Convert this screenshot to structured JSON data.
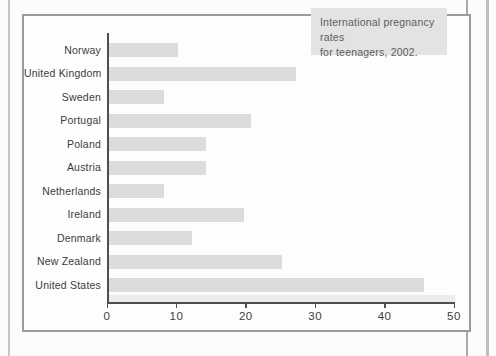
{
  "title_box": {
    "line1": "International pregnancy rates",
    "line2": "for teenagers, 2002."
  },
  "chart_data": {
    "type": "bar",
    "orientation": "horizontal",
    "title": "International pregnancy rates for teenagers, 2002.",
    "categories": [
      "Norway",
      "United Kingdom",
      "Sweden",
      "Portugal",
      "Poland",
      "Austria",
      "Netherlands",
      "Ireland",
      "Denmark",
      "New Zealand",
      "United States"
    ],
    "values": [
      10,
      27,
      8,
      20.5,
      14,
      14,
      8,
      19.5,
      12,
      25,
      45.5
    ],
    "xlabel": "",
    "ylabel": "",
    "xlim": [
      0,
      50
    ],
    "x_ticks": [
      0,
      10,
      20,
      30,
      40,
      50
    ],
    "grid": false,
    "legend": false,
    "bar_color": "#dcdcdc",
    "axis_color": "#4f4f4f",
    "title_box_background": "#e3e3e3"
  }
}
